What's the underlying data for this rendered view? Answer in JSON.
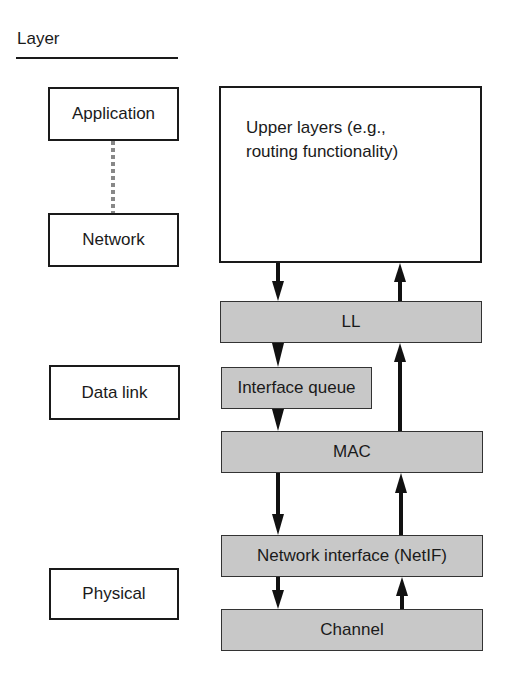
{
  "header": {
    "title": "Layer"
  },
  "layers": [
    {
      "id": "application",
      "label": "Application"
    },
    {
      "id": "network",
      "label": "Network"
    },
    {
      "id": "data-link",
      "label": "Data link"
    },
    {
      "id": "physical",
      "label": "Physical"
    }
  ],
  "components": {
    "upper": {
      "line1": "Upper layers (e.g.,",
      "line2": "routing functionality)"
    },
    "ll": "LL",
    "interface_queue": "Interface queue",
    "mac": "MAC",
    "netif": "Network interface (NetIF)",
    "channel": "Channel"
  },
  "colors": {
    "component_fill": "#c8c8c8",
    "line": "#1a1a1a",
    "dotted_link": "#888888"
  }
}
